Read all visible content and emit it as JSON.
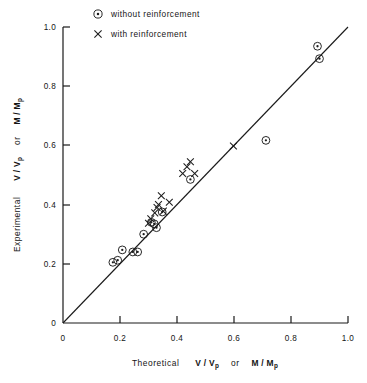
{
  "chart_data": {
    "type": "scatter",
    "title": "",
    "xlabel": "Theoretical   V / Vp   or   M / Mp",
    "ylabel": "Experimental   V / Vp   or   M / Mp",
    "xlim": [
      0,
      1.0
    ],
    "ylim": [
      0,
      1.0
    ],
    "grid": false,
    "legend_position": "top-left",
    "axis_label_parts": {
      "x_prefix": "Theoretical",
      "y_prefix": "Experimental",
      "quantity_1_main": "V / V",
      "quantity_1_sub": "p",
      "conjunction": "or",
      "quantity_2_main": "M / M",
      "quantity_2_sub": "p"
    },
    "xticks": [
      0,
      0.2,
      0.4,
      0.6,
      0.8,
      1.0
    ],
    "xticklabels": [
      "0",
      "0.2",
      "0.4",
      "0.6",
      "0.8",
      "1.0"
    ],
    "yticks": [
      0,
      0.2,
      0.4,
      0.6,
      0.8,
      1.0
    ],
    "yticklabels": [
      "0",
      "0.2",
      "0.4",
      "0.6",
      "0.8",
      "1.0"
    ],
    "reference_line": {
      "name": "equality-line",
      "from": [
        0,
        0
      ],
      "to": [
        1.0,
        1.0
      ],
      "label": "y = x"
    },
    "series": [
      {
        "name": "without reinforcement",
        "marker": "circle-dot",
        "values": [
          [
            0.175,
            0.205
          ],
          [
            0.192,
            0.212
          ],
          [
            0.208,
            0.247
          ],
          [
            0.245,
            0.24
          ],
          [
            0.262,
            0.24
          ],
          [
            0.283,
            0.3
          ],
          [
            0.31,
            0.34
          ],
          [
            0.32,
            0.335
          ],
          [
            0.328,
            0.322
          ],
          [
            0.348,
            0.375
          ],
          [
            0.447,
            0.485
          ],
          [
            0.712,
            0.617
          ],
          [
            0.893,
            0.935
          ],
          [
            0.9,
            0.893
          ]
        ]
      },
      {
        "name": "with reinforcement",
        "marker": "cross",
        "values": [
          [
            0.3,
            0.337
          ],
          [
            0.308,
            0.352
          ],
          [
            0.322,
            0.372
          ],
          [
            0.33,
            0.39
          ],
          [
            0.335,
            0.4
          ],
          [
            0.345,
            0.43
          ],
          [
            0.352,
            0.378
          ],
          [
            0.373,
            0.408
          ],
          [
            0.42,
            0.505
          ],
          [
            0.435,
            0.528
          ],
          [
            0.447,
            0.545
          ],
          [
            0.462,
            0.505
          ],
          [
            0.598,
            0.598
          ]
        ]
      }
    ],
    "legend": [
      {
        "label": "without reinforcement",
        "marker": "circle-dot"
      },
      {
        "label": "with reinforcement",
        "marker": "cross"
      }
    ]
  }
}
